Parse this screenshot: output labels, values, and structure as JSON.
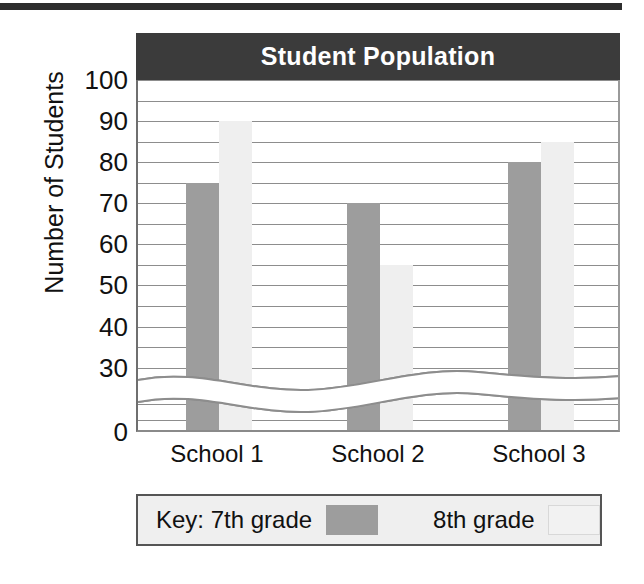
{
  "chart_data": {
    "type": "bar",
    "title": "Student Population",
    "xlabel": "",
    "ylabel": "Number of Students",
    "categories": [
      "School 1",
      "School 2",
      "School 3"
    ],
    "series": [
      {
        "name": "7th grade",
        "color": "#9d9d9d",
        "values": [
          75,
          70,
          80
        ]
      },
      {
        "name": "8th grade",
        "color": "#efefef",
        "values": [
          90,
          55,
          85
        ]
      }
    ],
    "ylim": [
      0,
      100
    ],
    "ytick_labels": [
      "100",
      "90",
      "80",
      "70",
      "60",
      "50",
      "40",
      "30",
      "0"
    ],
    "ytick_values": [
      100,
      90,
      80,
      70,
      60,
      50,
      40,
      30,
      0
    ],
    "gridline_values": [
      100,
      95,
      90,
      85,
      80,
      75,
      70,
      65,
      60,
      55,
      50,
      45,
      40,
      35,
      30,
      25
    ],
    "grid": true,
    "axis_break": true,
    "axis_break_note": "wavy break between 0 and 30",
    "legend_position": "below-plot"
  },
  "legend": {
    "key_label": "Key: 7th grade",
    "second_label": "8th grade"
  }
}
